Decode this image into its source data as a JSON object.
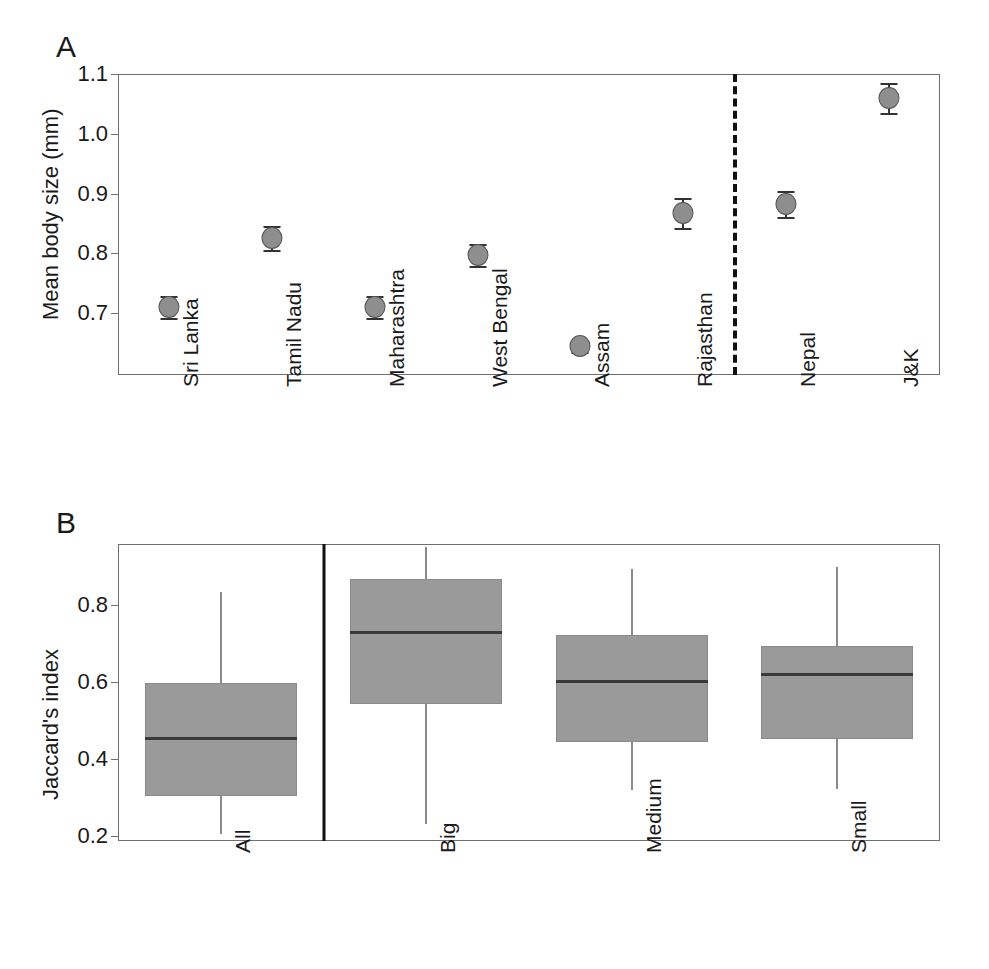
{
  "figure": {
    "width": 989,
    "height": 969,
    "background": "#ffffff",
    "point_fill": "#8e8e8e",
    "box_fill": "#9a9a9a",
    "axis_color": "#6f6f6f",
    "line_color": "#333333"
  },
  "panel_a": {
    "letter": "A",
    "ylabel": "Mean body size (mm)",
    "yticks": [
      "0.7",
      "0.8",
      "0.9",
      "1.0",
      "1.1"
    ],
    "categories": [
      "Sri Lanka",
      "Tamil Nadu",
      "Maharashtra",
      "West Bengal",
      "Assam",
      "Rajasthan",
      "Nepal",
      "J&K"
    ]
  },
  "panel_b": {
    "letter": "B",
    "ylabel": "Jaccard's index",
    "yticks": [
      "0.2",
      "0.4",
      "0.6",
      "0.8"
    ],
    "categories": [
      "All",
      "Big",
      "Medium",
      "Small"
    ]
  },
  "chart_data": [
    {
      "type": "scatter",
      "panel": "A",
      "title": "",
      "xlabel": "",
      "ylabel": "Mean body size (mm)",
      "ylim": [
        0.62,
        1.11
      ],
      "ytick_values": [
        0.7,
        0.8,
        0.9,
        1.0,
        1.1
      ],
      "grid": false,
      "legend": "none",
      "error_bars": "symmetric",
      "divider": {
        "style": "dashed",
        "after_category": "Rajasthan",
        "note": "separates Indian subcontinent regions from Nepal and J&K"
      },
      "categories": [
        "Sri Lanka",
        "Tamil Nadu",
        "Maharashtra",
        "West Bengal",
        "Assam",
        "Rajasthan",
        "Nepal",
        "J&K"
      ],
      "values": [
        0.71,
        0.825,
        0.71,
        0.797,
        0.644,
        0.868,
        0.883,
        1.06
      ],
      "errors": [
        0.018,
        0.02,
        0.018,
        0.018,
        0.01,
        0.025,
        0.022,
        0.025
      ]
    },
    {
      "type": "box",
      "panel": "B",
      "title": "",
      "xlabel": "",
      "ylabel": "Jaccard's index",
      "ylim": [
        0.17,
        0.97
      ],
      "ytick_values": [
        0.2,
        0.4,
        0.6,
        0.8
      ],
      "grid": false,
      "legend": "none",
      "divider": {
        "style": "solid",
        "after_category": "All",
        "note": "separates the pooled 'All' group from body-size classes"
      },
      "categories": [
        "All",
        "Big",
        "Medium",
        "Small"
      ],
      "boxes": [
        {
          "category": "All",
          "whisker_low": 0.205,
          "q1": 0.305,
          "median": 0.455,
          "q3": 0.598,
          "whisker_high": 0.835
        },
        {
          "category": "Big",
          "whisker_low": 0.232,
          "q1": 0.543,
          "median": 0.73,
          "q3": 0.868,
          "whisker_high": 0.95
        },
        {
          "category": "Medium",
          "whisker_low": 0.32,
          "q1": 0.443,
          "median": 0.603,
          "q3": 0.723,
          "whisker_high": 0.893
        },
        {
          "category": "Small",
          "whisker_low": 0.322,
          "q1": 0.452,
          "median": 0.62,
          "q3": 0.693,
          "whisker_high": 0.9
        }
      ]
    }
  ]
}
